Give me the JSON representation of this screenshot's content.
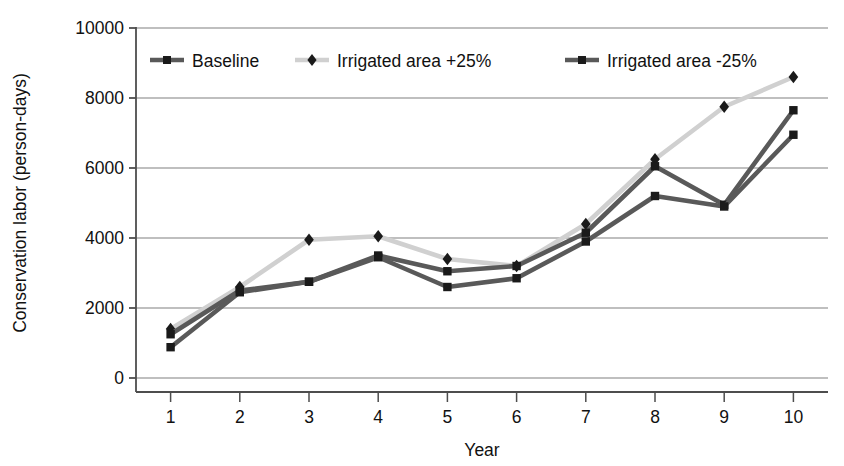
{
  "chart_data": {
    "type": "line",
    "title": "",
    "xlabel": "Year",
    "ylabel": "Conservation labor (person-days)",
    "x": [
      1,
      2,
      3,
      4,
      5,
      6,
      7,
      8,
      9,
      10
    ],
    "xticklabels": [
      "1",
      "2",
      "3",
      "4",
      "5",
      "6",
      "7",
      "8",
      "9",
      "10"
    ],
    "yticklabels": [
      "0",
      "2000",
      "4000",
      "6000",
      "8000",
      "10000"
    ],
    "yticks": [
      0,
      2000,
      4000,
      6000,
      8000,
      10000
    ],
    "ylim": [
      0,
      10000
    ],
    "xlim": [
      0.5,
      10.5
    ],
    "grid": "horizontal",
    "legend_position": "top-inside",
    "series": [
      {
        "name": "Baseline",
        "marker": "square",
        "color": "#595959",
        "marker_color": "#1a1a1a",
        "values": [
          1250,
          2500,
          2750,
          3500,
          3050,
          3200,
          4150,
          6050,
          4950,
          7650
        ]
      },
      {
        "name": "Irrigated area +25%",
        "marker": "diamond",
        "color": "#d0d0d0",
        "marker_color": "#1a1a1a",
        "values": [
          1400,
          2600,
          3950,
          4050,
          3400,
          3200,
          4400,
          6250,
          7750,
          8600
        ]
      },
      {
        "name": "Irrigated area -25%",
        "marker": "square",
        "color": "#595959",
        "marker_color": "#1a1a1a",
        "values": [
          880,
          2450,
          2750,
          3450,
          2600,
          2850,
          3900,
          5200,
          4900,
          6950
        ]
      }
    ]
  },
  "axis_colors": {
    "gridline": "#808080",
    "axis": "#4d4d4d",
    "text": "#111111"
  }
}
